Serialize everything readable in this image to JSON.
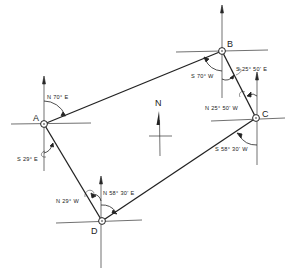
{
  "diagram": {
    "type": "survey traverse with bearings",
    "north_label": "N",
    "stations": [
      {
        "id": "A",
        "label": "A"
      },
      {
        "id": "B",
        "label": "B"
      },
      {
        "id": "C",
        "label": "C"
      },
      {
        "id": "D",
        "label": "D"
      }
    ],
    "bearings": {
      "A_to_B": "N 70°  E",
      "A_to_D": "S 29° E",
      "B_to_A": "S 70°  W",
      "B_to_C": "S 25°  50' E",
      "C_to_B": "N 25°  50' W",
      "C_to_D": "S 58°  30' W",
      "D_to_A": "N 29°  W",
      "D_to_C": "N 58°  30' E"
    }
  }
}
